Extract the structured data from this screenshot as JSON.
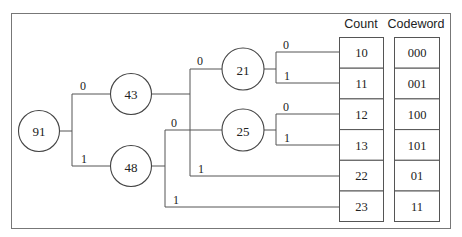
{
  "diagram": {
    "type": "huffman-tree",
    "nodes": {
      "root": "91",
      "n43": "43",
      "n48": "48",
      "n21": "21",
      "n25": "25"
    },
    "edges": {
      "root_0": "0",
      "root_1": "1",
      "n43_0": "0",
      "n43_1": "1",
      "n48_0": "0",
      "n48_1": "1",
      "n21_0": "0",
      "n21_1": "1",
      "n25_0": "0",
      "n25_1": "1"
    },
    "table": {
      "headers": {
        "count": "Count",
        "codeword": "Codeword"
      },
      "rows": [
        {
          "count": "10",
          "codeword": "000"
        },
        {
          "count": "11",
          "codeword": "001"
        },
        {
          "count": "12",
          "codeword": "100"
        },
        {
          "count": "13",
          "codeword": "101"
        },
        {
          "count": "22",
          "codeword": "01"
        },
        {
          "count": "23",
          "codeword": "11"
        }
      ]
    }
  }
}
